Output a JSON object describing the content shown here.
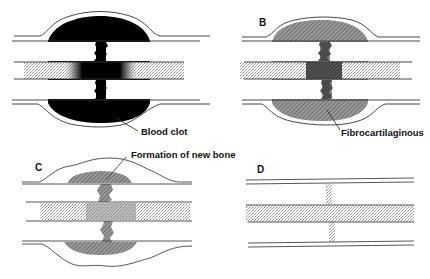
{
  "figure": {
    "panels": [
      {
        "id": "A",
        "label": "",
        "annotation": "Blood clot",
        "fill": "#000000"
      },
      {
        "id": "B",
        "label": "B",
        "annotation": "Fibrocartilaginous",
        "fill": "hatched-gray"
      },
      {
        "id": "C",
        "label": "C",
        "annotation": "Formation of new bone",
        "fill": "hatched-patches"
      },
      {
        "id": "D",
        "label": "D",
        "annotation": "",
        "fill": "healed"
      }
    ]
  },
  "colors": {
    "line": "#333333",
    "clot": "#000000",
    "stipple": "#bdbdbd",
    "hatch": "#555555",
    "background": "#ffffff"
  }
}
